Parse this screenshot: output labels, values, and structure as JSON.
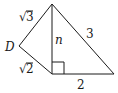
{
  "diagram": {
    "type": "geometry",
    "vertices": {
      "top": {
        "x": 52,
        "y": 4
      },
      "D": {
        "x": 19,
        "y": 46
      },
      "foot": {
        "x": 52,
        "y": 74
      },
      "right": {
        "x": 114,
        "y": 74
      }
    },
    "labels": {
      "top_left_side": "3",
      "top_left_side_root": "√",
      "vertex_D": "D",
      "bottom_left_side": "2",
      "bottom_left_side_root": "√",
      "altitude": "n",
      "hypotenuse": "3",
      "base": "2"
    },
    "right_angle_marker": true,
    "stroke_color": "#1a1a1a"
  }
}
